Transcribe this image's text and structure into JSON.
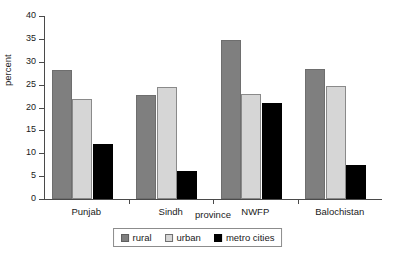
{
  "chart_data": {
    "type": "bar",
    "title": "",
    "xlabel": "province",
    "ylabel": "percent",
    "categories": [
      "Punjab",
      "Sindh",
      "NWFP",
      "Balochistan"
    ],
    "series": [
      {
        "name": "rural",
        "color": "#7f7f7f",
        "values": [
          28.3,
          22.7,
          34.7,
          28.5
        ]
      },
      {
        "name": "urban",
        "color": "#d6d6d6",
        "values": [
          21.8,
          24.4,
          22.9,
          24.7
        ]
      },
      {
        "name": "metro cities",
        "color": "#000000",
        "values": [
          12.1,
          6.1,
          21.0,
          7.4
        ]
      }
    ],
    "ylim": [
      0,
      40
    ],
    "yticks": [
      0,
      5,
      10,
      15,
      20,
      25,
      30,
      35,
      40
    ],
    "ytick_labels": [
      "0",
      "5",
      "10",
      "15",
      "20",
      "25",
      "30",
      "35",
      "40"
    ],
    "grid": false,
    "legend_position": "bottom"
  },
  "legend": {
    "items": [
      {
        "label": "rural"
      },
      {
        "label": "urban"
      },
      {
        "label": "metro cities"
      }
    ]
  }
}
